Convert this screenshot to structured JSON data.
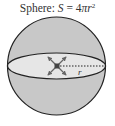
{
  "title": {
    "prefix": "Sphere: ",
    "var_s": "S",
    "equals": " = 4",
    "pi": "π",
    "var_r": "r",
    "exponent": "2"
  },
  "diagram": {
    "radius_label": "r",
    "colors": {
      "sphere_fill": "#c8c8c8",
      "equator_fill": "#e6e6e6",
      "stroke": "#222222",
      "arrows": "#666666"
    }
  }
}
